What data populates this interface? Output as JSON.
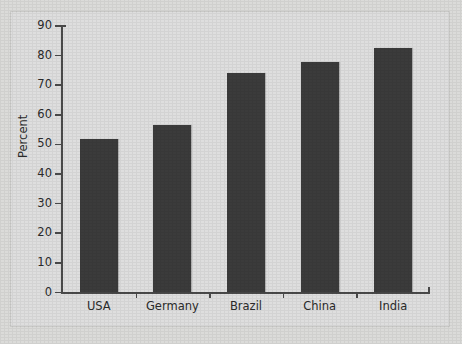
{
  "chart_data": {
    "type": "bar",
    "title": "",
    "subtitle": "",
    "xlabel": "",
    "ylabel": "Percent",
    "categories": [
      "USA",
      "Germany",
      "Brazil",
      "China",
      "India"
    ],
    "values": [
      52,
      56.5,
      74,
      78,
      82.5
    ],
    "ylim": [
      0,
      90
    ],
    "yticks": [
      0,
      10,
      20,
      30,
      40,
      50,
      60,
      70,
      80,
      90
    ],
    "ytick_labels": [
      "0",
      "10",
      "20",
      "30",
      "40",
      "50",
      "60",
      "70",
      "80",
      "90"
    ],
    "grid": false,
    "legend": null,
    "bar_color": "#3b3b3b",
    "plot_background": "#dedede",
    "axis_color": "#4a4a4a",
    "text_color": "#2b2b2b"
  }
}
